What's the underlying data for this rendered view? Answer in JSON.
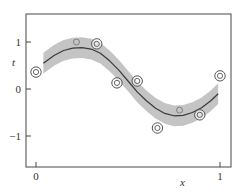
{
  "chart_data": {
    "type": "scatter",
    "title": "",
    "xlabel": "x",
    "ylabel": "t",
    "xlim": [
      -0.055,
      1.06
    ],
    "ylim": [
      -1.66,
      1.58
    ],
    "x_ticks": [
      0,
      1
    ],
    "x_tick_labels": [
      "0",
      "1"
    ],
    "y_ticks": [
      -1,
      0,
      1
    ],
    "y_tick_labels": [
      "−1",
      "0",
      "1"
    ],
    "grid": false,
    "legend": null,
    "series": [
      {
        "name": "observations",
        "type": "scatter",
        "marker": "double-circle",
        "points": [
          {
            "x": 0.0,
            "t": 0.36,
            "style": "double"
          },
          {
            "x": 0.22,
            "t": 1.0,
            "style": "single"
          },
          {
            "x": 0.33,
            "t": 0.96,
            "style": "double"
          },
          {
            "x": 0.44,
            "t": 0.13,
            "style": "double"
          },
          {
            "x": 0.55,
            "t": 0.17,
            "style": "double"
          },
          {
            "x": 0.66,
            "t": -0.83,
            "style": "double"
          },
          {
            "x": 0.78,
            "t": -0.45,
            "style": "single"
          },
          {
            "x": 0.89,
            "t": -0.55,
            "style": "double"
          },
          {
            "x": 1.0,
            "t": 0.28,
            "style": "double"
          }
        ]
      },
      {
        "name": "predictive mean",
        "type": "line",
        "color": "#3a3a3a",
        "x": [
          0.04,
          0.1,
          0.15,
          0.2,
          0.25,
          0.3,
          0.35,
          0.4,
          0.45,
          0.5,
          0.55,
          0.6,
          0.65,
          0.7,
          0.75,
          0.8,
          0.85,
          0.9,
          0.95,
          0.99
        ],
        "t": [
          0.55,
          0.72,
          0.82,
          0.87,
          0.88,
          0.85,
          0.76,
          0.6,
          0.4,
          0.17,
          -0.06,
          -0.25,
          -0.41,
          -0.52,
          -0.57,
          -0.56,
          -0.5,
          -0.4,
          -0.25,
          -0.1
        ]
      },
      {
        "name": "predictive std band",
        "type": "area",
        "color": "#c4c4c4",
        "half_width": 0.22
      }
    ]
  }
}
